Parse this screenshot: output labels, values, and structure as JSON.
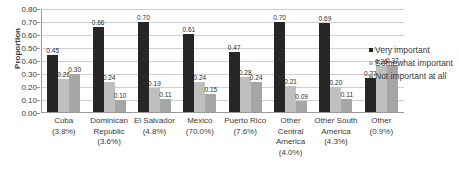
{
  "chart_data": {
    "type": "bar",
    "title": "",
    "xlabel": "",
    "ylabel": "Proportion",
    "ylim": [
      0,
      0.8
    ],
    "ytick_step": 0.1,
    "grid": true,
    "legend_position": "right",
    "ytick_labels": [
      "0.80",
      "0.70",
      "0.60",
      "0.50",
      "0.40",
      "0.30",
      "0.20",
      "0.10",
      "0.00"
    ],
    "categories": [
      {
        "name": "Cuba",
        "pct": "(3.8%)"
      },
      {
        "name": "Dominican Republic",
        "pct": "(3.6%)"
      },
      {
        "name": "El Salvador",
        "pct": "(4.8%)"
      },
      {
        "name": "Mexico",
        "pct": "(70.0%)"
      },
      {
        "name": "Puerto Rico",
        "pct": "(7.6%)"
      },
      {
        "name": "Other Central America",
        "pct": "(4.0%)"
      },
      {
        "name": "Other South America",
        "pct": "(4.3%)"
      },
      {
        "name": "Other",
        "pct": "(0.9%)"
      }
    ],
    "series": [
      {
        "name": "Very important",
        "color": "#262626",
        "values": [
          0.45,
          0.66,
          0.7,
          0.61,
          0.47,
          0.7,
          0.69,
          0.27
        ],
        "labels": [
          "0.45",
          "0.66",
          "0.70",
          "0.61",
          "0.47",
          "0.70",
          "0.69",
          "0.27"
        ]
      },
      {
        "name": "Somewhat important",
        "color": "#bfbfbf",
        "values": [
          0.26,
          0.24,
          0.19,
          0.24,
          0.28,
          0.21,
          0.2,
          0.36
        ],
        "labels": [
          "0.26",
          "0.24",
          "0.19",
          "0.24",
          "0.28",
          "0.21",
          "0.20",
          "0.36"
        ]
      },
      {
        "name": "Not important at all",
        "color": "#a6a6a6",
        "values": [
          0.3,
          0.1,
          0.11,
          0.15,
          0.24,
          0.09,
          0.11,
          0.37
        ],
        "labels": [
          "0.30",
          "0.10",
          "0.11",
          "0.15",
          "0.24",
          "0.09",
          "0.11",
          "0.37"
        ]
      }
    ]
  }
}
